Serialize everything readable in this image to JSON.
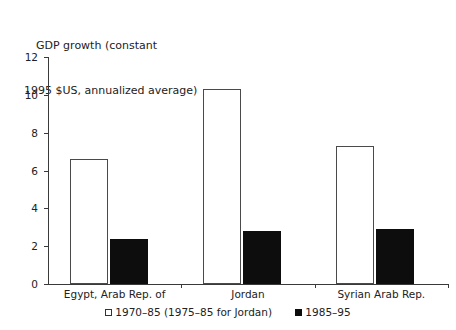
{
  "chart_data": {
    "type": "bar",
    "title": "GDP growth (constant 1995 $US, annualized average)",
    "title_lines": [
      "GDP growth (constant",
      "1995 $US, annualized average)"
    ],
    "xlabel": "",
    "ylabel": "",
    "ylim": [
      0,
      12
    ],
    "ytick_labels": [
      "0",
      "2",
      "4",
      "6",
      "8",
      "10",
      "12"
    ],
    "ytick_values": [
      0,
      2,
      4,
      6,
      8,
      10,
      12
    ],
    "grid": false,
    "legend_position": "bottom",
    "categories": [
      "Egypt, Arab Rep. of",
      "Jordan",
      "Syrian Arab Rep."
    ],
    "series": [
      {
        "name": "1970–85 (1975–85 for Jordan)",
        "marker": "open-square",
        "color": "#ffffff",
        "values": [
          6.6,
          10.3,
          7.3
        ]
      },
      {
        "name": "1985–95",
        "marker": "filled-square",
        "color": "#0d0d0d",
        "values": [
          2.4,
          2.8,
          2.9
        ]
      }
    ]
  },
  "colors": {
    "axis": "#3a3a3a",
    "text": "#222222",
    "series_open_fill": "#ffffff",
    "series_open_stroke": "#4a4a4a",
    "series_filled": "#0d0d0d",
    "background": "#ffffff"
  }
}
